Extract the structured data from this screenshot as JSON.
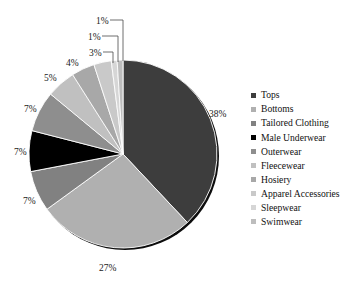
{
  "chart_data": {
    "type": "pie",
    "title": "",
    "subtitle": "",
    "xlabel": "",
    "ylabel": "",
    "legend_position": "right",
    "grid": false,
    "value_suffix": "%",
    "categories": [
      "Tops",
      "Bottoms",
      "Tailored Clothing",
      "Male Underwear",
      "Outerwear",
      "Fleecewear",
      "Hosiery",
      "Apparel Accessories",
      "Sleepwear",
      "Swimwear"
    ],
    "values": [
      38,
      27,
      7,
      7,
      7,
      5,
      4,
      3,
      1,
      1
    ],
    "labels": [
      "38%",
      "27%",
      "7%",
      "7%",
      "7%",
      "5%",
      "4%",
      "3%",
      "1%",
      "1%"
    ],
    "colors": [
      "#3d3d3d",
      "#b0b0b0",
      "#818181",
      "#000000",
      "#8e8e8e",
      "#c0c0c0",
      "#a8a8a8",
      "#c9c9c9",
      "#d6d6d6",
      "#bdbdbd"
    ],
    "slices": [
      {
        "name": "Tops",
        "value": 38,
        "label": "38%",
        "color": "#3d3d3d"
      },
      {
        "name": "Bottoms",
        "value": 27,
        "label": "27%",
        "color": "#b0b0b0"
      },
      {
        "name": "Tailored Clothing",
        "value": 7,
        "label": "7%",
        "color": "#818181"
      },
      {
        "name": "Male Underwear",
        "value": 7,
        "label": "7%",
        "color": "#000000"
      },
      {
        "name": "Outerwear",
        "value": 7,
        "label": "7%",
        "color": "#8e8e8e"
      },
      {
        "name": "Fleecewear",
        "value": 5,
        "label": "5%",
        "color": "#c0c0c0"
      },
      {
        "name": "Hosiery",
        "value": 4,
        "label": "4%",
        "color": "#a8a8a8"
      },
      {
        "name": "Apparel Accessories",
        "value": 3,
        "label": "3%",
        "color": "#c9c9c9"
      },
      {
        "name": "Sleepwear",
        "value": 1,
        "label": "1%",
        "color": "#d6d6d6"
      },
      {
        "name": "Swimwear",
        "value": 1,
        "label": "1%",
        "color": "#bdbdbd"
      }
    ]
  },
  "legend": {
    "items": [
      {
        "label": "Tops",
        "color": "#3d3d3d"
      },
      {
        "label": "Bottoms",
        "color": "#b0b0b0"
      },
      {
        "label": "Tailored Clothing",
        "color": "#818181"
      },
      {
        "label": "Male Underwear",
        "color": "#000000"
      },
      {
        "label": "Outerwear",
        "color": "#8e8e8e"
      },
      {
        "label": "Fleecewear",
        "color": "#c0c0c0"
      },
      {
        "label": "Hosiery",
        "color": "#a8a8a8"
      },
      {
        "label": "Apparel Accessories",
        "color": "#c9c9c9"
      },
      {
        "label": "Sleepwear",
        "color": "#d6d6d6"
      },
      {
        "label": "Swimwear",
        "color": "#bdbdbd"
      }
    ]
  },
  "geometry": {
    "cx": 123,
    "cy": 154,
    "r": 94,
    "shadow_offset": 2
  },
  "callouts": [
    {
      "label": "38%",
      "x": 209,
      "y": 117,
      "anchor": "start",
      "leader": null
    },
    {
      "label": "27%",
      "x": 99,
      "y": 271,
      "anchor": "start",
      "leader": null
    },
    {
      "label": "7%",
      "x": 23,
      "y": 204,
      "anchor": "start",
      "leader": null
    },
    {
      "label": "7%",
      "x": 14,
      "y": 155,
      "anchor": "start",
      "leader": null
    },
    {
      "label": "7%",
      "x": 24,
      "y": 112,
      "anchor": "start",
      "leader": null
    },
    {
      "label": "5%",
      "x": 44,
      "y": 81,
      "anchor": "start",
      "leader": null
    },
    {
      "label": "4%",
      "x": 66,
      "y": 66,
      "anchor": "start",
      "leader": null
    },
    {
      "label": "3%",
      "x": 89,
      "y": 56,
      "anchor": "start",
      "leader": "M 103,52 L 113,52 L 113,63"
    },
    {
      "label": "1%",
      "x": 88,
      "y": 40,
      "anchor": "start",
      "leader": "M 102,36 L 118,36 L 118,62"
    },
    {
      "label": "1%",
      "x": 96,
      "y": 24,
      "anchor": "start",
      "leader": "M 110,20 L 123,20 L 123,61"
    }
  ]
}
